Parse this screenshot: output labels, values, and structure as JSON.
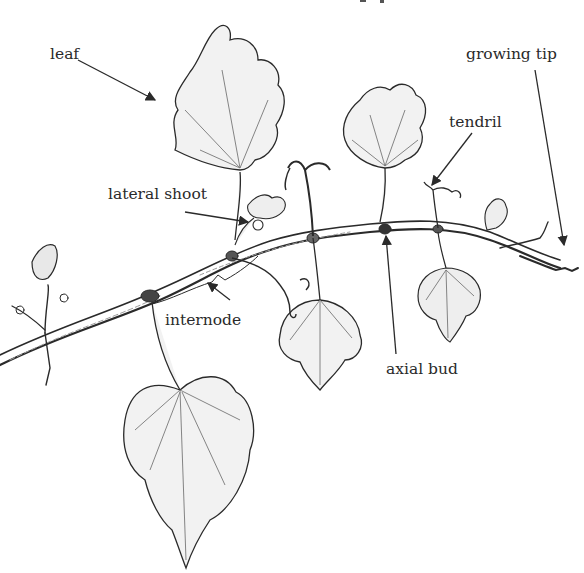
{
  "diagram": {
    "title_partial": "…phology",
    "labels": [
      {
        "id": "leaf",
        "text": "leaf",
        "x": 50,
        "y": 48
      },
      {
        "id": "growing-tip",
        "text": "growing tip",
        "x": 466,
        "y": 48
      },
      {
        "id": "tendril",
        "text": "tendril",
        "x": 449,
        "y": 117
      },
      {
        "id": "lateral-shoot",
        "text": "lateral shoot",
        "x": 108,
        "y": 188
      },
      {
        "id": "internode",
        "text": "internode",
        "x": 165,
        "y": 314
      },
      {
        "id": "axial-bud",
        "text": "axial bud",
        "x": 386,
        "y": 363
      }
    ],
    "colors": {
      "ink": "#2a2a2a",
      "shade": "#9a9a9a",
      "background": "#ffffff"
    }
  }
}
